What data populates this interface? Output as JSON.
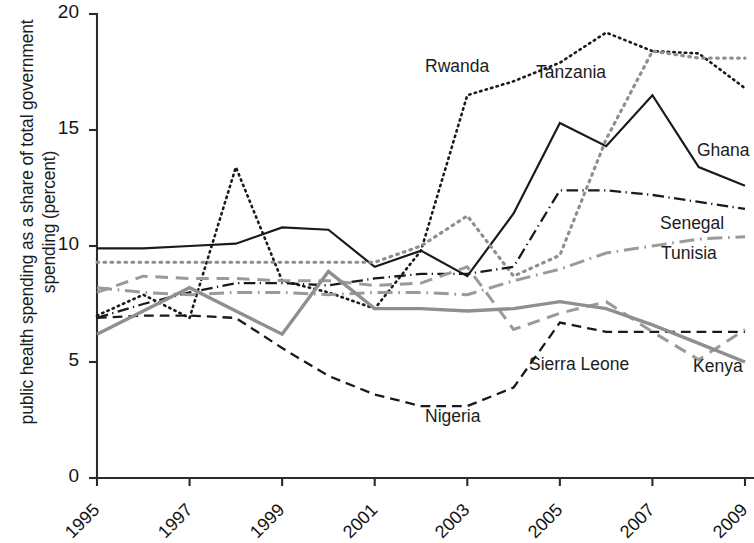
{
  "chart_data": {
    "type": "line",
    "title": "",
    "xlabel": "",
    "ylabel": "public health spending as a share of total government spending (percent)",
    "xlim": [
      1995,
      2009
    ],
    "ylim": [
      0,
      20
    ],
    "yticks": [
      0,
      5,
      10,
      15,
      20
    ],
    "xticks": [
      1995,
      1997,
      1999,
      2001,
      2003,
      2005,
      2007,
      2009
    ],
    "xtick_labels": [
      "1995",
      "1997",
      "1999",
      "2001",
      "2003",
      "2005",
      "2007",
      "2009"
    ],
    "ytick_labels": [
      "0",
      "5",
      "10",
      "15",
      "20"
    ],
    "grid": false,
    "legend": "inline-labels",
    "x": [
      1995,
      1996,
      1997,
      1998,
      1999,
      2000,
      2001,
      2002,
      2003,
      2004,
      2005,
      2006,
      2007,
      2008,
      2009
    ],
    "series": [
      {
        "name": "Ghana",
        "color": "#1a1a1a",
        "style": "solid",
        "width": 2.2,
        "values": [
          9.9,
          9.9,
          10.0,
          10.1,
          10.8,
          10.7,
          9.1,
          9.8,
          8.7,
          11.4,
          15.3,
          14.3,
          16.5,
          13.4,
          12.6
        ],
        "label_x": 697,
        "label_y": 140
      },
      {
        "name": "Rwanda",
        "color": "#1a1a1a",
        "style": "dotted",
        "width": 2.6,
        "values": [
          7.0,
          7.9,
          6.9,
          13.4,
          8.5,
          8.0,
          7.3,
          9.8,
          16.5,
          17.1,
          17.9,
          19.2,
          18.4,
          18.3,
          16.8
        ],
        "label_x": 425,
        "label_y": 56
      },
      {
        "name": "Tanzania",
        "color": "#8f8f8f",
        "style": "dotted",
        "width": 3.2,
        "values": [
          9.3,
          9.3,
          9.3,
          9.3,
          9.3,
          9.3,
          9.3,
          10.0,
          11.3,
          8.7,
          9.6,
          14.6,
          18.4,
          18.1,
          18.1
        ],
        "label_x": 536,
        "label_y": 62
      },
      {
        "name": "Senegal",
        "color": "#1a1a1a",
        "style": "dashdot",
        "width": 2.3,
        "values": [
          6.9,
          7.5,
          8.0,
          8.4,
          8.4,
          8.3,
          8.6,
          8.8,
          8.8,
          9.1,
          12.4,
          12.4,
          12.2,
          11.9,
          11.6
        ],
        "label_x": 660,
        "label_y": 213
      },
      {
        "name": "Tunisia",
        "color": "#9a9a9a",
        "style": "dashdot",
        "width": 3.0,
        "values": [
          8.2,
          8.0,
          7.9,
          8.0,
          8.0,
          7.9,
          8.0,
          8.0,
          7.9,
          8.5,
          9.0,
          9.7,
          10.0,
          10.3,
          10.4
        ],
        "label_x": 661,
        "label_y": 243
      },
      {
        "name": "Nigeria",
        "color": "#1a1a1a",
        "style": "dashed",
        "width": 2.3,
        "values": [
          6.9,
          7.0,
          7.0,
          6.9,
          5.6,
          4.4,
          3.6,
          3.1,
          3.1,
          3.9,
          6.7,
          6.3,
          6.3,
          6.3,
          6.3
        ],
        "label_x": 425,
        "label_y": 406
      },
      {
        "name": "Sierra Leone",
        "color": "#9a9a9a",
        "style": "dashed",
        "width": 3.0,
        "values": [
          8.0,
          8.7,
          8.6,
          8.6,
          8.5,
          8.5,
          8.3,
          8.4,
          9.1,
          6.4,
          7.1,
          7.6,
          6.3,
          5.1,
          6.4
        ],
        "label_x": 529,
        "label_y": 354
      },
      {
        "name": "Kenya",
        "color": "#8f8f8f",
        "style": "solid",
        "width": 3.4,
        "values": [
          6.2,
          7.2,
          8.2,
          7.2,
          6.2,
          8.9,
          7.3,
          7.3,
          7.2,
          7.3,
          7.6,
          7.3,
          6.6,
          5.8,
          5.0
        ],
        "label_x": 693,
        "label_y": 356
      }
    ]
  },
  "axes": {
    "origin_px": {
      "x": 97,
      "y": 478
    },
    "x_right_px": 745,
    "y_top_px": 14
  }
}
